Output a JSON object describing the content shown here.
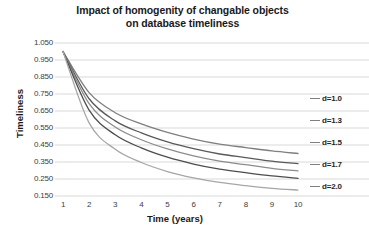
{
  "chart_data": {
    "type": "line",
    "title": "Impact of homogenity of changable objects on database timeliness",
    "title_line1": "Impact of homogenity of changable objects",
    "title_line2": "on database timeliness",
    "xlabel": "Time (years)",
    "ylabel": "Timeliness",
    "x": [
      1,
      2,
      3,
      4,
      5,
      6,
      7,
      8,
      9,
      10
    ],
    "xlim": [
      1,
      10
    ],
    "ylim": [
      0.15,
      1.05
    ],
    "grid": true,
    "legend_position": "right",
    "xticks": [
      "1",
      "2",
      "3",
      "4",
      "5",
      "6",
      "7",
      "8",
      "9",
      "10"
    ],
    "yticks": [
      "1.050",
      "0.950",
      "0.850",
      "0.750",
      "0.650",
      "0.550",
      "0.450",
      "0.350",
      "0.250",
      "0.150"
    ],
    "ytick_values": [
      1.05,
      0.95,
      0.85,
      0.75,
      0.65,
      0.55,
      0.45,
      0.35,
      0.25,
      0.15
    ],
    "series": [
      {
        "name": "d=2.0",
        "color": "#7f7f7f",
        "values": [
          1.0,
          0.758,
          0.64,
          0.574,
          0.524,
          0.485,
          0.455,
          0.435,
          0.415,
          0.4
        ]
      },
      {
        "name": "d=1.7",
        "color": "#595959",
        "values": [
          1.0,
          0.722,
          0.592,
          0.521,
          0.468,
          0.428,
          0.397,
          0.376,
          0.355,
          0.34
        ]
      },
      {
        "name": "d=1.5",
        "color": "#8c8c8c",
        "values": [
          1.0,
          0.693,
          0.556,
          0.481,
          0.427,
          0.386,
          0.355,
          0.334,
          0.313,
          0.298
        ]
      },
      {
        "name": "d=1.3",
        "color": "#4d4d4d",
        "values": [
          1.0,
          0.655,
          0.51,
          0.433,
          0.378,
          0.338,
          0.308,
          0.287,
          0.268,
          0.254
        ]
      },
      {
        "name": "d=1.0",
        "color": "#a6a6a6",
        "values": [
          1.0,
          0.58,
          0.425,
          0.347,
          0.294,
          0.257,
          0.23,
          0.211,
          0.195,
          0.185
        ]
      }
    ],
    "legend": [
      "d=1.0",
      "d=1.3",
      "d=1.5",
      "d=1.7",
      "d=2.0"
    ]
  },
  "legend_items": [
    {
      "label": "d=1.0"
    },
    {
      "label": "d=1.3"
    },
    {
      "label": "d=1.5"
    },
    {
      "label": "d=1.7"
    },
    {
      "label": "d=2.0"
    }
  ],
  "colors": {
    "gridline": "#d9d9d9",
    "text": "#3d3d3d",
    "title": "#1a1a1a",
    "background": "#ffffff"
  }
}
